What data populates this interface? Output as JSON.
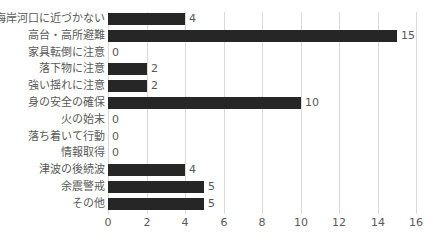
{
  "chart_data": {
    "type": "bar",
    "orientation": "horizontal",
    "title": "",
    "xlabel": "",
    "ylabel": "",
    "categories": [
      "海岸河口に近づかない",
      "高台・高所避難",
      "家具転倒に注意",
      "落下物に注意",
      "強い揺れに注意",
      "身の安全の確保",
      "火の始末",
      "落ち着いて行動",
      "情報取得",
      "津波の後続波",
      "余震警戒",
      "その他"
    ],
    "values": [
      4,
      15,
      0,
      2,
      2,
      10,
      0,
      0,
      0,
      4,
      5,
      5
    ],
    "xlim": [
      0,
      16
    ],
    "xticks": [
      0,
      2,
      4,
      6,
      8,
      10,
      12,
      14,
      16
    ],
    "grid": true,
    "legend": null,
    "data_labels": true,
    "bar_color": "#262626"
  }
}
